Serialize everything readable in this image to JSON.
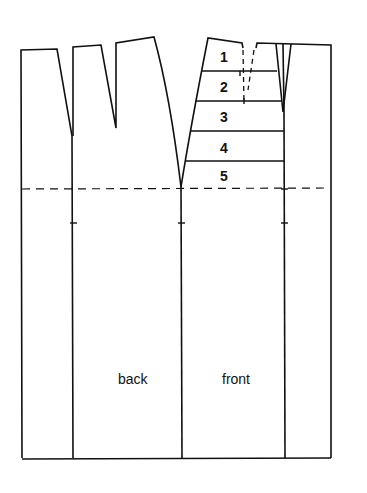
{
  "diagram": {
    "type": "skirt-pattern-draft",
    "panels": [
      {
        "label": "back"
      },
      {
        "label": "front"
      }
    ],
    "sections": [
      "1",
      "2",
      "3",
      "4",
      "5"
    ],
    "hip_line": "dashed",
    "colors": {
      "ink": "#111111",
      "paper": "#ffffff"
    }
  }
}
